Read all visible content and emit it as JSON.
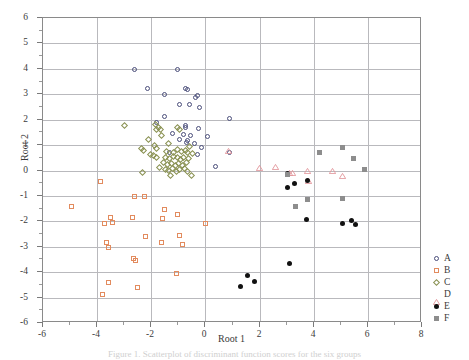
{
  "figure": {
    "caption_partial": "Figure 1. Scatterplot of discriminant function scores for the six groups",
    "background_color": "#ffffff"
  },
  "chart_data": {
    "type": "scatter",
    "title": "",
    "xlabel": "Root 1",
    "ylabel": "Root 2",
    "xlim": [
      -6,
      8
    ],
    "ylim": [
      -6,
      6
    ],
    "xticks": [
      -6,
      -4,
      -2,
      0,
      2,
      4,
      6,
      8
    ],
    "xtick_labels": [
      "-6",
      "-4",
      "-2",
      "0",
      "2",
      "4",
      "6",
      "8"
    ],
    "yticks": [
      -6,
      -5,
      -4,
      -3,
      -2,
      -1,
      0,
      1,
      2,
      3,
      4,
      5,
      6
    ],
    "ytick_labels": [
      "-6",
      "-5",
      "-4",
      "-3",
      "-2",
      "-1",
      "0",
      "1",
      "2",
      "3",
      "4",
      "5",
      "6"
    ],
    "xminor_step": 1,
    "yminor_step": 0.5,
    "grid": true,
    "grid_color": "#b9b9bd",
    "legend_position": "right-outside",
    "series": [
      {
        "name": "A",
        "marker": "circle-open",
        "color": "#4a4e7a",
        "points": [
          [
            -2.63,
            3.97
          ],
          [
            -1.02,
            3.96
          ],
          [
            -2.15,
            3.22
          ],
          [
            -1.53,
            3.0
          ],
          [
            -0.73,
            3.23
          ],
          [
            -0.68,
            3.18
          ],
          [
            -0.31,
            2.94
          ],
          [
            -0.38,
            2.89
          ],
          [
            -0.97,
            2.6
          ],
          [
            -0.58,
            2.58
          ],
          [
            -0.23,
            2.46
          ],
          [
            -1.51,
            2.12
          ],
          [
            0.9,
            2.03
          ],
          [
            -1.8,
            1.88
          ],
          [
            -0.72,
            1.78
          ],
          [
            -0.73,
            1.68
          ],
          [
            -0.24,
            1.64
          ],
          [
            -1.22,
            1.45
          ],
          [
            -0.81,
            1.41
          ],
          [
            -0.56,
            1.37
          ],
          [
            0.09,
            1.33
          ],
          [
            -0.94,
            1.23
          ],
          [
            -0.66,
            1.18
          ],
          [
            -0.7,
            1.1
          ],
          [
            -0.42,
            1.05
          ],
          [
            -0.15,
            0.91
          ],
          [
            0.88,
            0.71
          ],
          [
            -1.32,
            0.72
          ],
          [
            -0.29,
            0.61
          ],
          [
            0.37,
            0.17
          ]
        ]
      },
      {
        "name": "B",
        "marker": "square-open",
        "color": "#e28b5e",
        "points": [
          [
            -3.87,
            -0.42
          ],
          [
            -4.95,
            -1.4
          ],
          [
            -2.62,
            -1.03
          ],
          [
            -2.25,
            -1.02
          ],
          [
            -1.52,
            -1.54
          ],
          [
            -1.04,
            -1.74
          ],
          [
            -2.71,
            -1.84
          ],
          [
            -3.5,
            -1.83
          ],
          [
            -3.74,
            -2.09
          ],
          [
            -3.44,
            -2.04
          ],
          [
            -1.58,
            -1.9
          ],
          [
            0.02,
            -2.07
          ],
          [
            -3.66,
            -2.85
          ],
          [
            -3.58,
            -3.03
          ],
          [
            -2.22,
            -2.6
          ],
          [
            -1.64,
            -2.85
          ],
          [
            -0.95,
            -2.57
          ],
          [
            -0.86,
            -2.92
          ],
          [
            -2.66,
            -3.46
          ],
          [
            -2.58,
            -3.55
          ],
          [
            -3.57,
            -4.41
          ],
          [
            -3.8,
            -4.89
          ],
          [
            -2.5,
            -4.6
          ],
          [
            -1.07,
            -4.05
          ]
        ]
      },
      {
        "name": "C",
        "marker": "diamond-open",
        "color": "#8a9152",
        "points": [
          [
            -2.98,
            1.78
          ],
          [
            -1.86,
            1.81
          ],
          [
            -1.75,
            1.7
          ],
          [
            -1.81,
            1.6
          ],
          [
            -1.65,
            1.63
          ],
          [
            -1.03,
            1.68
          ],
          [
            -0.97,
            1.6
          ],
          [
            -2.1,
            1.23
          ],
          [
            -1.37,
            1.05
          ],
          [
            -2.35,
            0.88
          ],
          [
            -2.28,
            0.78
          ],
          [
            -1.88,
            0.98
          ],
          [
            -1.79,
            0.88
          ],
          [
            -1.44,
            0.74
          ],
          [
            -1.19,
            0.72
          ],
          [
            -1.02,
            0.82
          ],
          [
            -0.88,
            0.74
          ],
          [
            -0.73,
            0.8
          ],
          [
            -0.65,
            0.72
          ],
          [
            -0.48,
            0.68
          ],
          [
            -1.9,
            0.58
          ],
          [
            -1.82,
            0.5
          ],
          [
            -1.47,
            0.53
          ],
          [
            -1.32,
            0.48
          ],
          [
            -1.18,
            0.55
          ],
          [
            -1.05,
            0.5
          ],
          [
            -0.92,
            0.45
          ],
          [
            -0.8,
            0.52
          ],
          [
            -0.62,
            0.46
          ],
          [
            -1.56,
            0.3
          ],
          [
            -1.41,
            0.22
          ],
          [
            -1.27,
            0.28
          ],
          [
            -1.12,
            0.18
          ],
          [
            -0.98,
            0.26
          ],
          [
            -0.84,
            0.2
          ],
          [
            -0.7,
            0.3
          ],
          [
            -1.48,
            0.05
          ],
          [
            -1.36,
            0.0
          ],
          [
            -1.21,
            0.07
          ],
          [
            -1.08,
            -0.02
          ],
          [
            -0.94,
            0.04
          ],
          [
            -1.3,
            -0.18
          ],
          [
            -0.52,
            -0.18
          ],
          [
            -2.34,
            -0.08
          ],
          [
            -0.58,
            0.95
          ],
          [
            -1.62,
            1.36
          ],
          [
            -2.02,
            0.62
          ],
          [
            -0.76,
            0.08
          ],
          [
            -1.7,
            0.1
          ],
          [
            -0.66,
            -0.04
          ]
        ]
      },
      {
        "name": "D",
        "marker": "triangle-open",
        "color": "#e2959b",
        "points": [
          [
            0.85,
            1.09
          ],
          [
            2.0,
            0.42
          ],
          [
            2.6,
            0.45
          ],
          [
            3.1,
            0.2
          ],
          [
            3.22,
            0.22
          ],
          [
            3.78,
            0.28
          ],
          [
            3.8,
            -0.09
          ],
          [
            4.68,
            0.29
          ],
          [
            5.08,
            0.1
          ]
        ]
      },
      {
        "name": "E",
        "marker": "circle-fill",
        "color": "#111111",
        "points": [
          [
            3.02,
            -0.12
          ],
          [
            3.05,
            -0.66
          ],
          [
            3.28,
            -0.52
          ],
          [
            3.78,
            -0.4
          ],
          [
            3.74,
            -1.92
          ],
          [
            5.05,
            -2.1
          ],
          [
            5.38,
            -1.96
          ],
          [
            5.53,
            -2.14
          ],
          [
            3.1,
            -3.64
          ],
          [
            1.57,
            -4.13
          ],
          [
            1.8,
            -4.38
          ],
          [
            1.29,
            -4.58
          ]
        ]
      },
      {
        "name": "F",
        "marker": "square-fill",
        "color": "#8d8d8d",
        "points": [
          [
            4.22,
            0.71
          ],
          [
            5.05,
            0.89
          ],
          [
            5.47,
            0.47
          ],
          [
            5.87,
            0.04
          ],
          [
            3.78,
            -1.13
          ],
          [
            3.32,
            -1.4
          ],
          [
            5.05,
            -1.12
          ],
          [
            3.05,
            -0.14
          ]
        ]
      }
    ]
  },
  "legend": {
    "items": [
      {
        "label": "A",
        "marker": "circle-open",
        "color": "#4a4e7a"
      },
      {
        "label": "B",
        "marker": "square-open",
        "color": "#e28b5e"
      },
      {
        "label": "C",
        "marker": "diamond-open",
        "color": "#8a9152"
      },
      {
        "label": "D",
        "marker": "triangle-open",
        "color": "#e2959b"
      },
      {
        "label": "E",
        "marker": "circle-fill",
        "color": "#111111"
      },
      {
        "label": "F",
        "marker": "square-fill",
        "color": "#8d8d8d"
      }
    ]
  }
}
